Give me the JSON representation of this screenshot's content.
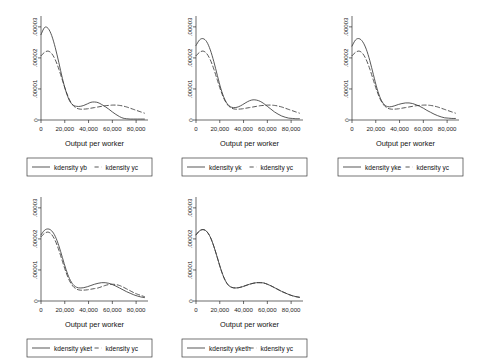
{
  "figure": {
    "background_color": "#ffffff",
    "line_color": "#3a3a3a",
    "axis_color": "#2b2b2b",
    "panel_count": 5,
    "layout": "3 panels top row, 2 panels bottom row"
  },
  "chart_data": [
    {
      "type": "line",
      "title": "",
      "xlabel": "Output per worker",
      "ylabel": "",
      "xlim": [
        0,
        90000
      ],
      "ylim": [
        0,
        3.35e-05
      ],
      "grid": false,
      "legend_position": "below",
      "xticks": [
        0,
        20000,
        40000,
        60000,
        80000
      ],
      "xticklabels": [
        "0",
        "20,000",
        "40,000",
        "60,000",
        "80,000"
      ],
      "yticks": [
        0,
        1e-05,
        2e-05,
        3e-05
      ],
      "yticklabels": [
        "0",
        ".00001",
        ".00002",
        ".00003"
      ],
      "series": [
        {
          "name": "kdensity yb",
          "style": "solid",
          "x": [
            0,
            3000,
            6000,
            9000,
            12000,
            15000,
            18000,
            21000,
            24000,
            27000,
            30000,
            33000,
            36000,
            39000,
            42000,
            45000,
            48000,
            51000,
            54000,
            57000,
            60000,
            63000,
            66000,
            69000,
            72000,
            75000,
            78000,
            81000,
            84000,
            87000
          ],
          "y": [
            2.75e-05,
            2.98e-05,
            2.95e-05,
            2.72e-05,
            2.33e-05,
            1.85e-05,
            1.34e-05,
            9.2e-06,
            6.2e-06,
            4.8e-06,
            4.4e-06,
            4.4e-06,
            4.7e-06,
            5.2e-06,
            5.7e-06,
            5.8e-06,
            5.6e-06,
            5e-06,
            4.3e-06,
            3.5e-06,
            2.6e-06,
            1.8e-06,
            1.1e-06,
            6e-07,
            4e-07,
            3e-07,
            3e-07,
            3e-07,
            3e-07,
            3e-07
          ]
        },
        {
          "name": "kdensity yc",
          "style": "dashed",
          "x": [
            0,
            3000,
            6000,
            9000,
            12000,
            15000,
            18000,
            21000,
            24000,
            27000,
            30000,
            33000,
            36000,
            39000,
            42000,
            45000,
            48000,
            51000,
            54000,
            57000,
            60000,
            63000,
            66000,
            69000,
            72000,
            75000,
            78000,
            81000,
            84000,
            87000
          ],
          "y": [
            2.07e-05,
            2.18e-05,
            2.22e-05,
            2.14e-05,
            1.94e-05,
            1.64e-05,
            1.28e-05,
            9.3e-06,
            6.5e-06,
            4.7e-06,
            3.8e-06,
            3.5e-06,
            3.5e-06,
            3.6e-06,
            3.8e-06,
            4e-06,
            4.2e-06,
            4.4e-06,
            4.6e-06,
            4.7e-06,
            4.8e-06,
            4.8e-06,
            4.7e-06,
            4.5e-06,
            4.2e-06,
            3.8e-06,
            3.4e-06,
            3e-06,
            2.6e-06,
            2.2e-06
          ]
        }
      ]
    },
    {
      "type": "line",
      "title": "",
      "xlabel": "Output per worker",
      "ylabel": "",
      "xlim": [
        0,
        90000
      ],
      "ylim": [
        0,
        3.35e-05
      ],
      "grid": false,
      "legend_position": "below",
      "xticks": [
        0,
        20000,
        40000,
        60000,
        80000
      ],
      "xticklabels": [
        "0",
        "20,000",
        "40,000",
        "60,000",
        "80,000"
      ],
      "yticks": [
        0,
        1e-05,
        2e-05,
        3e-05
      ],
      "yticklabels": [
        "0",
        ".00001",
        ".00002",
        ".00003"
      ],
      "series": [
        {
          "name": "kdensity yk",
          "style": "solid",
          "x": [
            0,
            3000,
            6000,
            9000,
            12000,
            15000,
            18000,
            21000,
            24000,
            27000,
            30000,
            33000,
            36000,
            39000,
            42000,
            45000,
            48000,
            51000,
            54000,
            57000,
            60000,
            63000,
            66000,
            69000,
            72000,
            75000,
            78000,
            81000,
            84000,
            87000
          ],
          "y": [
            2.4e-05,
            2.58e-05,
            2.62e-05,
            2.52e-05,
            2.26e-05,
            1.88e-05,
            1.43e-05,
            1e-05,
            6.8e-06,
            4.9e-06,
            4.1e-06,
            4e-06,
            4.3e-06,
            4.9e-06,
            5.6e-06,
            6.2e-06,
            6.5e-06,
            6.4e-06,
            6e-06,
            5.3e-06,
            4.4e-06,
            3.5e-06,
            2.6e-06,
            1.9e-06,
            1.3e-06,
            9e-07,
            6e-07,
            5e-07,
            4e-07,
            4e-07
          ]
        },
        {
          "name": "kdensity yc",
          "style": "dashed",
          "x": [
            0,
            3000,
            6000,
            9000,
            12000,
            15000,
            18000,
            21000,
            24000,
            27000,
            30000,
            33000,
            36000,
            39000,
            42000,
            45000,
            48000,
            51000,
            54000,
            57000,
            60000,
            63000,
            66000,
            69000,
            72000,
            75000,
            78000,
            81000,
            84000,
            87000
          ],
          "y": [
            2.07e-05,
            2.18e-05,
            2.22e-05,
            2.14e-05,
            1.94e-05,
            1.64e-05,
            1.28e-05,
            9.3e-06,
            6.5e-06,
            4.7e-06,
            3.8e-06,
            3.5e-06,
            3.5e-06,
            3.6e-06,
            3.8e-06,
            4e-06,
            4.2e-06,
            4.4e-06,
            4.6e-06,
            4.7e-06,
            4.8e-06,
            4.8e-06,
            4.7e-06,
            4.5e-06,
            4.2e-06,
            3.8e-06,
            3.4e-06,
            3e-06,
            2.6e-06,
            2.2e-06
          ]
        }
      ]
    },
    {
      "type": "line",
      "title": "",
      "xlabel": "Output per worker",
      "ylabel": "",
      "xlim": [
        0,
        90000
      ],
      "ylim": [
        0,
        3.35e-05
      ],
      "grid": false,
      "legend_position": "below",
      "xticks": [
        0,
        20000,
        40000,
        60000,
        80000
      ],
      "xticklabels": [
        "0",
        "20,000",
        "40,000",
        "60,000",
        "80,000"
      ],
      "yticks": [
        0,
        1e-05,
        2e-05,
        3e-05
      ],
      "yticklabels": [
        "0",
        ".00001",
        ".00002",
        ".00003"
      ],
      "series": [
        {
          "name": "kdensity yke",
          "style": "solid",
          "x": [
            0,
            3000,
            6000,
            9000,
            12000,
            15000,
            18000,
            21000,
            24000,
            27000,
            30000,
            33000,
            36000,
            39000,
            42000,
            45000,
            48000,
            51000,
            54000,
            57000,
            60000,
            63000,
            66000,
            69000,
            72000,
            75000,
            78000,
            81000,
            84000,
            87000
          ],
          "y": [
            2.38e-05,
            2.58e-05,
            2.62e-05,
            2.52e-05,
            2.28e-05,
            1.91e-05,
            1.46e-05,
            1.02e-05,
            6.9e-06,
            5e-06,
            4.3e-06,
            4.3e-06,
            4.6e-06,
            5e-06,
            5.3e-06,
            5.5e-06,
            5.5e-06,
            5.3e-06,
            4.9e-06,
            4.4e-06,
            3.8e-06,
            3.1e-06,
            2.5e-06,
            1.9e-06,
            1.4e-06,
            1e-06,
            7e-07,
            6e-07,
            5e-07,
            5e-07
          ]
        },
        {
          "name": "kdensity yc",
          "style": "dashed",
          "x": [
            0,
            3000,
            6000,
            9000,
            12000,
            15000,
            18000,
            21000,
            24000,
            27000,
            30000,
            33000,
            36000,
            39000,
            42000,
            45000,
            48000,
            51000,
            54000,
            57000,
            60000,
            63000,
            66000,
            69000,
            72000,
            75000,
            78000,
            81000,
            84000,
            87000
          ],
          "y": [
            2.07e-05,
            2.18e-05,
            2.22e-05,
            2.14e-05,
            1.94e-05,
            1.64e-05,
            1.28e-05,
            9.3e-06,
            6.5e-06,
            4.7e-06,
            3.8e-06,
            3.5e-06,
            3.5e-06,
            3.6e-06,
            3.8e-06,
            4e-06,
            4.2e-06,
            4.4e-06,
            4.6e-06,
            4.7e-06,
            4.8e-06,
            4.8e-06,
            4.7e-06,
            4.5e-06,
            4.2e-06,
            3.8e-06,
            3.4e-06,
            3e-06,
            2.6e-06,
            2.2e-06
          ]
        }
      ]
    },
    {
      "type": "line",
      "title": "",
      "xlabel": "Output per worker",
      "ylabel": "",
      "xlim": [
        0,
        90000
      ],
      "ylim": [
        0,
        3.35e-05
      ],
      "grid": false,
      "legend_position": "below",
      "xticks": [
        0,
        20000,
        40000,
        60000,
        80000
      ],
      "xticklabels": [
        "0",
        "20,000",
        "40,000",
        "60,000",
        "80,000"
      ],
      "yticks": [
        0,
        1e-05,
        2e-05,
        3e-05
      ],
      "yticklabels": [
        "0",
        ".00001",
        ".00002",
        ".00003"
      ],
      "series": [
        {
          "name": "kdensity yket",
          "style": "solid",
          "x": [
            0,
            3000,
            6000,
            9000,
            12000,
            15000,
            18000,
            21000,
            24000,
            27000,
            30000,
            33000,
            36000,
            39000,
            42000,
            45000,
            48000,
            51000,
            54000,
            57000,
            60000,
            63000,
            66000,
            69000,
            72000,
            75000,
            78000,
            81000,
            84000,
            87000
          ],
          "y": [
            2.13e-05,
            2.28e-05,
            2.32e-05,
            2.26e-05,
            2.08e-05,
            1.78e-05,
            1.4e-05,
            1.02e-05,
            7.2e-06,
            5.3e-06,
            4.4e-06,
            4.2e-06,
            4.3e-06,
            4.6e-06,
            5e-06,
            5.4e-06,
            5.7e-06,
            5.9e-06,
            5.9e-06,
            5.7e-06,
            5.3e-06,
            4.8e-06,
            4.2e-06,
            3.6e-06,
            3e-06,
            2.5e-06,
            2e-06,
            1.6e-06,
            1.3e-06,
            1.1e-06
          ]
        },
        {
          "name": "kdensity yc",
          "style": "dashed",
          "x": [
            0,
            3000,
            6000,
            9000,
            12000,
            15000,
            18000,
            21000,
            24000,
            27000,
            30000,
            33000,
            36000,
            39000,
            42000,
            45000,
            48000,
            51000,
            54000,
            57000,
            60000,
            63000,
            66000,
            69000,
            72000,
            75000,
            78000,
            81000,
            84000,
            87000
          ],
          "y": [
            2.07e-05,
            2.18e-05,
            2.22e-05,
            2.14e-05,
            1.94e-05,
            1.64e-05,
            1.28e-05,
            9.3e-06,
            6.5e-06,
            4.7e-06,
            3.8e-06,
            3.5e-06,
            3.5e-06,
            3.6e-06,
            3.8e-06,
            4e-06,
            4.2e-06,
            4.6e-06,
            5e-06,
            5.3e-06,
            5.4e-06,
            5.3e-06,
            5e-06,
            4.5e-06,
            3.9e-06,
            3.3e-06,
            2.7e-06,
            2.2e-06,
            1.8e-06,
            1.4e-06
          ]
        }
      ]
    },
    {
      "type": "line",
      "title": "",
      "xlabel": "Output per worker",
      "ylabel": "",
      "xlim": [
        0,
        90000
      ],
      "ylim": [
        0,
        3.35e-05
      ],
      "grid": false,
      "legend_position": "below",
      "xticks": [
        0,
        20000,
        40000,
        60000,
        80000
      ],
      "xticklabels": [
        "0",
        "20,000",
        "40,000",
        "60,000",
        "80,000"
      ],
      "yticks": [
        0,
        1e-05,
        2e-05,
        3e-05
      ],
      "yticklabels": [
        "0",
        ".00001",
        ".00002",
        ".00003"
      ],
      "series": [
        {
          "name": "kdensity yketh",
          "style": "solid",
          "x": [
            0,
            3000,
            6000,
            9000,
            12000,
            15000,
            18000,
            21000,
            24000,
            27000,
            30000,
            33000,
            36000,
            39000,
            42000,
            45000,
            48000,
            51000,
            54000,
            57000,
            60000,
            63000,
            66000,
            69000,
            72000,
            75000,
            78000,
            81000,
            84000,
            87000
          ],
          "y": [
            2.13e-05,
            2.26e-05,
            2.3e-05,
            2.24e-05,
            2.06e-05,
            1.76e-05,
            1.39e-05,
            1.01e-05,
            7.1e-06,
            5.2e-06,
            4.4e-06,
            4.2e-06,
            4.3e-06,
            4.6e-06,
            5e-06,
            5.4e-06,
            5.7e-06,
            5.9e-06,
            5.9e-06,
            5.8e-06,
            5.4e-06,
            4.9e-06,
            4.3e-06,
            3.7e-06,
            3.1e-06,
            2.6e-06,
            2.1e-06,
            1.7e-06,
            1.4e-06,
            1.2e-06
          ]
        },
        {
          "name": "kdensity yc",
          "style": "dashed",
          "x": [
            0,
            3000,
            6000,
            9000,
            12000,
            15000,
            18000,
            21000,
            24000,
            27000,
            30000,
            33000,
            36000,
            39000,
            42000,
            45000,
            48000,
            51000,
            54000,
            57000,
            60000,
            63000,
            66000,
            69000,
            72000,
            75000,
            78000,
            81000,
            84000,
            87000
          ],
          "y": [
            2.13e-05,
            2.26e-05,
            2.3e-05,
            2.24e-05,
            2.06e-05,
            1.76e-05,
            1.39e-05,
            1.01e-05,
            7.1e-06,
            5.2e-06,
            4.4e-06,
            4.2e-06,
            4.3e-06,
            4.6e-06,
            5e-06,
            5.4e-06,
            5.7e-06,
            5.9e-06,
            5.9e-06,
            5.8e-06,
            5.4e-06,
            4.9e-06,
            4.3e-06,
            3.7e-06,
            3.1e-06,
            2.6e-06,
            2.1e-06,
            1.7e-06,
            1.4e-06,
            1.2e-06
          ]
        }
      ]
    }
  ]
}
